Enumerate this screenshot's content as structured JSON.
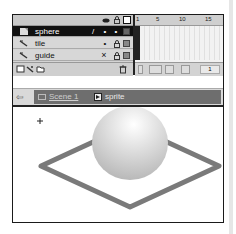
{
  "timeline": {
    "header_icons": [
      "eye-icon",
      "lock-icon",
      "outline-icon"
    ],
    "layers": [
      {
        "name": "sphere",
        "icon": "layer-icon",
        "selected": true,
        "edit": "/",
        "visible": "•",
        "locked": "•"
      },
      {
        "name": "tile",
        "icon": "motion-guided-icon",
        "selected": false,
        "edit": "",
        "visible": "•",
        "locked": "lock"
      },
      {
        "name": "guide",
        "icon": "motion-guide-icon",
        "selected": false,
        "edit": "",
        "visible": "×",
        "locked": "lock"
      }
    ],
    "footer_icons": [
      "insert-layer-icon",
      "add-motion-guide-icon",
      "insert-folder-icon",
      "delete-layer-icon"
    ],
    "ruler_ticks": [
      "1",
      "5",
      "10",
      "15"
    ],
    "current_frame": "1",
    "frame_buttons": [
      "center-frame-icon",
      "onion-skin-icon",
      "onion-outlines-icon",
      "edit-multiple-icon",
      "onion-markers-icon"
    ]
  },
  "editbar": {
    "back_label": "⇦",
    "scene_label": "Scene 1",
    "symbol_label": "sprite"
  },
  "stage": {
    "registration_mark": "+",
    "colors": {
      "tile": "#7a7a7a",
      "sphere_light": "#ffffff",
      "sphere_dark": "#b8b8b8"
    }
  }
}
